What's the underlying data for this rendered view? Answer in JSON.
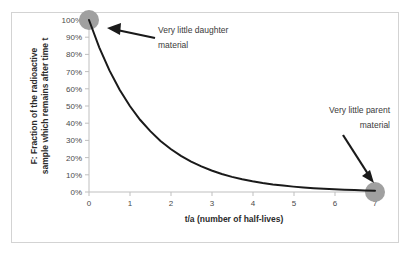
{
  "figure": {
    "background_color": "#ffffff",
    "border_color": "#d3d3d3"
  },
  "chart_data": {
    "type": "line",
    "title": "",
    "subtitle": "",
    "xlabel": "t/a (number of half-lives)",
    "ylabel": "F: Fraction of the radioactive sample which remains after time t",
    "ylabel_line1": "F: Fraction of the radioactive",
    "ylabel_line2": "sample which remains after time t",
    "xlim": [
      0,
      7
    ],
    "ylim": [
      0,
      1.0
    ],
    "grid": false,
    "legend": "none",
    "line_color": "#1a1a1a",
    "line_width": 2,
    "marker_color": "#a0a0a0",
    "x_tick_labels": [
      "0",
      "1",
      "2",
      "3",
      "4",
      "5",
      "6",
      "7"
    ],
    "x_ticks": [
      0,
      1,
      2,
      3,
      4,
      5,
      6,
      7
    ],
    "y_tick_labels": [
      "0%",
      "10%",
      "20%",
      "30%",
      "40%",
      "50%",
      "60%",
      "70%",
      "80%",
      "90%",
      "100%"
    ],
    "y_ticks": [
      0,
      0.1,
      0.2,
      0.3,
      0.4,
      0.5,
      0.6,
      0.7,
      0.8,
      0.9,
      1.0
    ],
    "series": [
      {
        "name": "F = (1/2)^(t/a)",
        "x": [
          0,
          0.25,
          0.5,
          0.75,
          1,
          1.25,
          1.5,
          1.75,
          2,
          2.25,
          2.5,
          2.75,
          3,
          3.25,
          3.5,
          3.75,
          4,
          4.25,
          4.5,
          4.75,
          5,
          5.25,
          5.5,
          5.75,
          6,
          6.25,
          6.5,
          6.75,
          7
        ],
        "y": [
          1.0,
          0.841,
          0.707,
          0.595,
          0.5,
          0.42,
          0.354,
          0.297,
          0.25,
          0.21,
          0.177,
          0.149,
          0.125,
          0.105,
          0.088,
          0.074,
          0.0625,
          0.0526,
          0.0442,
          0.0372,
          0.03125,
          0.0263,
          0.0221,
          0.0186,
          0.015625,
          0.0131,
          0.011,
          0.0093,
          0.0078
        ]
      }
    ],
    "markers": [
      {
        "name": "start-marker",
        "x": 0,
        "y": 1.0
      },
      {
        "name": "end-marker",
        "x": 7,
        "y": 0.0
      }
    ],
    "annotations": [
      {
        "name": "daughter-annotation",
        "line1": "Very little daughter",
        "line2": "material",
        "points_to": {
          "x": 0,
          "y": 1.0
        }
      },
      {
        "name": "parent-annotation",
        "line1": "Very little parent",
        "line2": "material",
        "points_to": {
          "x": 7,
          "y": 0.0
        }
      }
    ]
  }
}
